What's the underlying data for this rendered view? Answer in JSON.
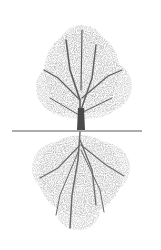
{
  "image": {
    "subject": "tree-with-mirrored-roots",
    "description": "Grayscale halftone illustration of a leafless tree canopy above a horizontal ground line with a mirrored root system below",
    "colors": {
      "background": "#ffffff",
      "canopy": "#8a8a8a",
      "trunk": "#4a4a4a",
      "ground_line": "#5a5a5a",
      "roots": "#8c8c8c"
    }
  }
}
